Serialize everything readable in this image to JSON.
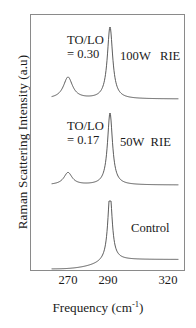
{
  "figure": {
    "axes": {
      "ylabel": "Raman Scattering Intensity (a.u)",
      "xlabel_text": "Frequency (cm",
      "xlabel_sup": "-1",
      "xlabel_close": ")",
      "xticks": [
        {
          "label": "270",
          "x": 68
        },
        {
          "label": "290",
          "x": 108
        },
        {
          "label": "320",
          "x": 168
        }
      ],
      "frame_color": "#8a8a8a",
      "curve_color": "#4a4a4a"
    },
    "annotations": {
      "top_ratio_line1": "TO/LO",
      "top_ratio_line2": "= 0.30",
      "mid_ratio_line1": "TO/LO",
      "mid_ratio_line2": "= 0.17",
      "top_trace_label": "100W   RIE",
      "mid_trace_label": "50W  RIE",
      "bottom_trace_label": "Control"
    }
  },
  "chart_data": {
    "type": "line",
    "title": "",
    "xlabel": "Frequency (cm-1)",
    "ylabel": "Raman Scattering Intensity (a.u)",
    "xlim": [
      262,
      325
    ],
    "xticks": [
      270,
      290,
      320
    ],
    "grid": false,
    "legend": "inline-right-labels",
    "series": [
      {
        "name": "100W RIE",
        "label": "100W   RIE",
        "offset_order": "top",
        "to_lo_ratio": 0.3,
        "peaks": [
          {
            "assignment": "TO",
            "center_cm1": 270,
            "relative_height": 0.3,
            "fwhm_cm1": 5.5
          },
          {
            "assignment": "LO",
            "center_cm1": 291,
            "relative_height": 1.0,
            "fwhm_cm1": 3.2
          }
        ]
      },
      {
        "name": "50W RIE",
        "label": "50W  RIE",
        "offset_order": "middle",
        "to_lo_ratio": 0.17,
        "peaks": [
          {
            "assignment": "TO",
            "center_cm1": 270,
            "relative_height": 0.17,
            "fwhm_cm1": 5.0
          },
          {
            "assignment": "LO",
            "center_cm1": 291,
            "relative_height": 1.0,
            "fwhm_cm1": 3.0
          }
        ]
      },
      {
        "name": "Control",
        "label": "Control",
        "offset_order": "bottom",
        "to_lo_ratio": 0.0,
        "peaks": [
          {
            "assignment": "LO",
            "center_cm1": 291,
            "relative_height": 1.0,
            "fwhm_cm1": 2.6
          }
        ]
      }
    ]
  }
}
